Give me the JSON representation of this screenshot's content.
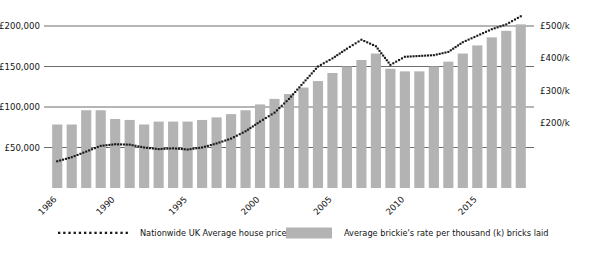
{
  "chart_data": {
    "type": "bar",
    "title": "",
    "subtitle": "",
    "xlabel": "",
    "ylabel": "",
    "grid": true,
    "legend_position": "bottom",
    "categories": [
      1986,
      1987,
      1988,
      1989,
      1990,
      1991,
      1992,
      1993,
      1994,
      1995,
      1996,
      1997,
      1998,
      1999,
      2000,
      2001,
      2002,
      2003,
      2004,
      2005,
      2006,
      2007,
      2008,
      2009,
      2010,
      2011,
      2012,
      2013,
      2014,
      2015,
      2016,
      2017,
      2018
    ],
    "x_tick_labels": [
      "1986",
      "1990",
      "1995",
      "2000",
      "2005",
      "2010",
      "2015"
    ],
    "x_tick_years": [
      1986,
      1990,
      1995,
      2000,
      2005,
      2010,
      2015
    ],
    "left_axis": {
      "ticks": [
        50000,
        100000,
        150000,
        200000
      ],
      "tick_labels": [
        "£50,000",
        "£100,000",
        "£150,000",
        "£200,000"
      ],
      "ylim": [
        0,
        237500
      ],
      "unit": "£"
    },
    "right_axis": {
      "ticks": [
        200,
        300,
        400,
        500
      ],
      "tick_labels": [
        "£200/k",
        "£300/k",
        "£400/k",
        "£500/k"
      ],
      "ylim": [
        0,
        475
      ],
      "unit": "£/k"
    },
    "series": [
      {
        "name": "Average brickie's rate per thousand (k) bricks laid",
        "type": "bar",
        "axis": "right",
        "color": "#b3b3b3",
        "values": [
          196,
          196,
          240,
          240,
          213,
          210,
          196,
          205,
          205,
          205,
          210,
          218,
          228,
          240,
          258,
          275,
          290,
          310,
          330,
          355,
          375,
          395,
          415,
          368,
          360,
          360,
          375,
          390,
          415,
          440,
          465,
          485,
          505
        ]
      },
      {
        "name": "Nationwide UK Average house prices",
        "type": "line",
        "style": "dotted",
        "axis": "left",
        "color": "#1a1a1a",
        "values": [
          33000,
          38000,
          45000,
          52000,
          54000,
          53500,
          50000,
          48000,
          49000,
          47500,
          50000,
          55000,
          61000,
          70000,
          82000,
          93000,
          110000,
          130000,
          150000,
          160000,
          172000,
          183000,
          175000,
          152000,
          162000,
          163000,
          164000,
          168000,
          180000,
          188000,
          196000,
          202000,
          212000
        ]
      }
    ],
    "legend": [
      {
        "label": "Nationwide UK Average house prices",
        "marker": "dotted-line",
        "color": "#1a1a1a"
      },
      {
        "label": "Average brickie's rate per thousand (k) bricks laid",
        "marker": "swatch",
        "color": "#b3b3b3"
      }
    ],
    "colors": {
      "bar": "#b3b3b3",
      "line": "#1a1a1a",
      "grid": "#5c5c5c",
      "text": "#141414",
      "background": "#ffffff"
    }
  }
}
